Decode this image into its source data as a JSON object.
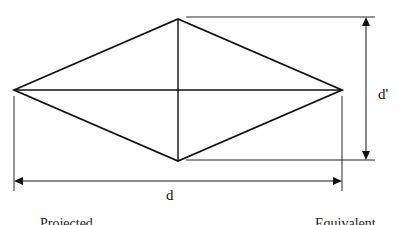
{
  "diagram": {
    "shape": "rhombus (diamond) indentation",
    "labels": {
      "horizontal_diagonal": "d",
      "vertical_diagonal": "d'"
    },
    "cut_off_captions": [
      "Projected",
      "Equivalent"
    ],
    "colors": {
      "line": "#111111",
      "background": "#ffffff"
    }
  }
}
